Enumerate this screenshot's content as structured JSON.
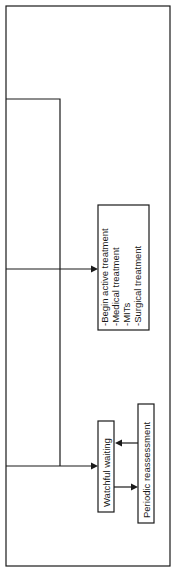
{
  "diagram": {
    "type": "flowchart",
    "orientation": "rotated-90-ccw",
    "colors": {
      "stroke": "#1a1a1a",
      "background": "#ffffff"
    },
    "nodes": [
      {
        "id": "active",
        "lines": [
          "-Begin active treatment",
          "-Medical treatment",
          "-MITs",
          "-Surgical treatment"
        ]
      },
      {
        "id": "watchful",
        "lines": [
          "Watchful waiting"
        ]
      },
      {
        "id": "periodic",
        "lines": [
          "Periodic reassessment"
        ]
      }
    ],
    "edges": [
      {
        "from": "outer-branch",
        "to": "active"
      },
      {
        "from": "outer-branch",
        "to": "watchful"
      },
      {
        "from": "watchful",
        "to": "periodic"
      },
      {
        "from": "periodic",
        "to": "watchful"
      }
    ]
  }
}
